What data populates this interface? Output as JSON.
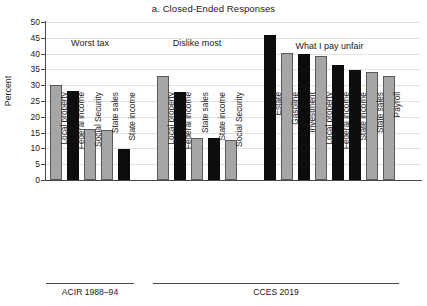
{
  "chart_data": {
    "type": "bar",
    "title": "a. Closed-Ended Responses",
    "xlabel": "",
    "ylabel": "Percent",
    "ylim": [
      0,
      50
    ],
    "ytick_step": 5,
    "yticks": [
      0,
      5,
      10,
      15,
      20,
      25,
      30,
      35,
      40,
      45,
      50
    ],
    "grid": true,
    "legend": "none",
    "colors": {
      "property_gray": "#a6a6a6",
      "income_black": "#0d0d0d",
      "axis": "#4a4a4a",
      "gridline": "#e2e2e2"
    },
    "annotations": [
      "Worst tax",
      "Dislike most",
      "What I pay unfair"
    ],
    "source_groups": [
      "ACIR 1988–94",
      "CCES 2019"
    ],
    "groups": [
      {
        "annotation": "Worst tax",
        "source": "ACIR 1988–94",
        "categories": [
          "Local property",
          "Federal income",
          "Social Security",
          "State sales",
          "State income"
        ],
        "values": [
          30.0,
          28.3,
          16.1,
          15.8,
          9.8
        ],
        "shades": [
          "gray",
          "black",
          "gray",
          "gray",
          "black"
        ]
      },
      {
        "annotation": "Dislike most",
        "source": "CCES 2019",
        "categories": [
          "Local property",
          "Federal income",
          "State sales",
          "State income",
          "Social Security"
        ],
        "values": [
          33.0,
          28.0,
          13.3,
          13.3,
          12.7
        ],
        "shades": [
          "gray",
          "black",
          "gray",
          "black",
          "gray"
        ]
      },
      {
        "annotation": "What I pay unfair",
        "source": "CCES 2019",
        "categories": [
          "Estate",
          "Gasoline",
          "Investment",
          "Local property",
          "Federal income",
          "State income",
          "State sales",
          "Payroll"
        ],
        "values": [
          45.9,
          40.3,
          39.9,
          39.2,
          36.3,
          34.7,
          34.2,
          33.0
        ],
        "shades": [
          "black",
          "gray",
          "black",
          "gray",
          "black",
          "black",
          "gray",
          "gray"
        ]
      }
    ]
  }
}
